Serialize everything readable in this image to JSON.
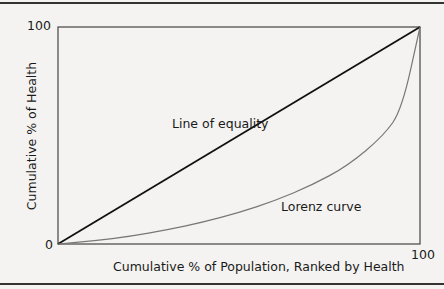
{
  "chart_data": {
    "type": "line",
    "title": "",
    "xlabel": "Cumulative % of Population, Ranked by Health",
    "ylabel": "Cumulative % of Health",
    "xlim": [
      0,
      100
    ],
    "ylim": [
      0,
      100
    ],
    "x_ticks": [
      "0",
      "100"
    ],
    "y_ticks": [
      "0",
      "100"
    ],
    "grid": false,
    "series": [
      {
        "name": "Line of equality",
        "x": [
          0,
          100
        ],
        "y": [
          0,
          100
        ],
        "color": "#111111"
      },
      {
        "name": "Lorenz curve",
        "x": [
          0,
          10,
          20,
          30,
          40,
          50,
          60,
          70,
          80,
          90,
          95,
          100
        ],
        "y": [
          0,
          1.5,
          3.5,
          6.5,
          10,
          14.5,
          20,
          27,
          36,
          50,
          62,
          100
        ],
        "color": "#777777"
      }
    ],
    "annotations": [
      {
        "text": "Line of equality",
        "x": 45,
        "y": 58
      },
      {
        "text": "Lorenz curve",
        "x": 62,
        "y": 20
      }
    ]
  },
  "labels": {
    "y_tick_top": "100",
    "y_tick_bottom": "0",
    "x_tick_right": "100",
    "x_axis": "Cumulative % of Population, Ranked by Health",
    "y_axis": "Cumulative % of Health",
    "equality": "Line of equality",
    "lorenz": "Lorenz curve"
  }
}
